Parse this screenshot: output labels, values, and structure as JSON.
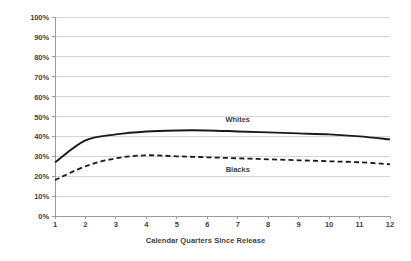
{
  "chart_data": {
    "type": "line",
    "title": "",
    "xlabel": "Calendar Quarters Since Release",
    "ylabel": "",
    "categories": [
      "1",
      "2",
      "3",
      "4",
      "5",
      "6",
      "7",
      "8",
      "9",
      "10",
      "11",
      "12"
    ],
    "x": [
      1,
      2,
      3,
      4,
      5,
      6,
      7,
      8,
      9,
      10,
      11,
      12
    ],
    "xlim": [
      1,
      12
    ],
    "ylim": [
      0,
      100
    ],
    "ytick_labels": [
      "0%",
      "10%",
      "20%",
      "30%",
      "40%",
      "50%",
      "60%",
      "70%",
      "80%",
      "90%",
      "100%"
    ],
    "ytick_values": [
      0,
      10,
      20,
      30,
      40,
      50,
      60,
      70,
      80,
      90,
      100
    ],
    "grid": "horizontal",
    "legend_position": "inline-annotation",
    "series": [
      {
        "name": "Whites",
        "style": "solid",
        "color": "#1a1a1a",
        "values": [
          27,
          38,
          41,
          42.5,
          43,
          43,
          42.5,
          42,
          41.5,
          41,
          40,
          38.5
        ]
      },
      {
        "name": "Blacks",
        "style": "dashed",
        "color": "#1a1a1a",
        "values": [
          18,
          25,
          29,
          30.5,
          30,
          29.5,
          29,
          28.5,
          28,
          27.5,
          27,
          26
        ]
      }
    ],
    "annotations": [
      {
        "text": "Whites",
        "x": 7,
        "y": 48.5
      },
      {
        "text": "Blacks",
        "x": 7,
        "y": 23.5
      }
    ]
  },
  "colors": {
    "line": "#1a1a1a",
    "grid": "#d4d4d4",
    "axis": "#9a9a9a",
    "text": "#3f3f3f",
    "background": "#ffffff"
  }
}
